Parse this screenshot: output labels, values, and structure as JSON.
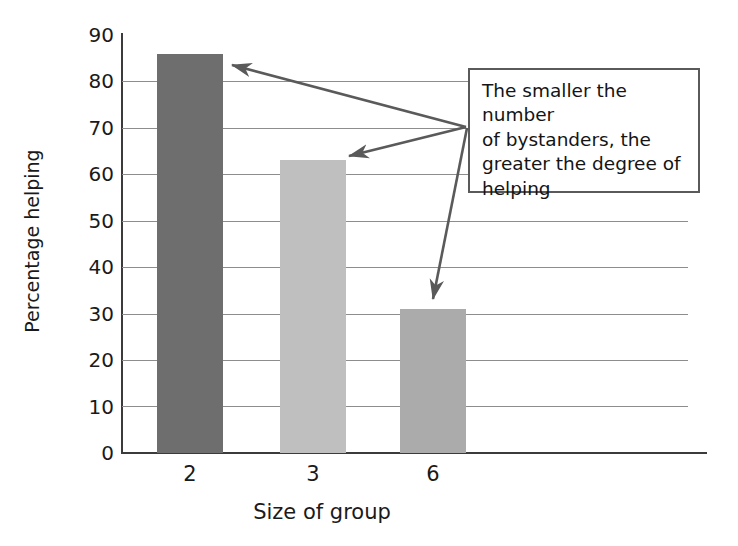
{
  "chart_data": {
    "type": "bar",
    "title": "",
    "subtitle": "",
    "xlabel": "Size of group",
    "ylabel": "Percentage helping",
    "categories": [
      "2",
      "3",
      "6"
    ],
    "values": [
      86,
      63,
      31
    ],
    "series": [
      {
        "name": "Percentage helping",
        "values": [
          86,
          63,
          31
        ]
      }
    ],
    "ylim": [
      0,
      90
    ],
    "ytick_step": 10,
    "yticks": [
      "90",
      "80",
      "70",
      "60",
      "50",
      "40",
      "30",
      "20",
      "10",
      "0"
    ],
    "grid": true,
    "legend": "none",
    "bar_colors": [
      "#6e6e6e",
      "#bfbfbf",
      "#ababab"
    ],
    "annotations": [
      {
        "text": "The smaller the number of bystanders, the greater the degree of helping",
        "lines": [
          "The smaller the number",
          "of bystanders, the",
          "greater the degree of",
          "helping"
        ],
        "points_to": [
          "2",
          "3",
          "6"
        ]
      }
    ]
  },
  "colors": {
    "axis": "#3b3b3b",
    "grid": "#8d8d8d",
    "arrow": "#5a5a5a",
    "box_border": "#5a5a5a",
    "text": "#1a1a1a",
    "background": "#ffffff"
  }
}
